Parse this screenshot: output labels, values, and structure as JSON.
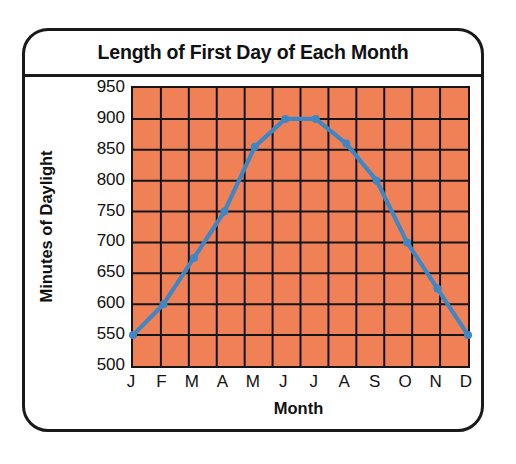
{
  "chart_data": {
    "type": "line",
    "title": "Length of First Day of Each Month",
    "xlabel": "Month",
    "ylabel": "Minutes of Daylight",
    "categories": [
      "J",
      "F",
      "M",
      "A",
      "M",
      "J",
      "J",
      "A",
      "S",
      "O",
      "N",
      "D"
    ],
    "month_names": [
      "January",
      "February",
      "March",
      "April",
      "May",
      "June",
      "July",
      "August",
      "September",
      "October",
      "November",
      "December"
    ],
    "values": [
      550,
      600,
      675,
      750,
      855,
      900,
      900,
      860,
      800,
      700,
      625,
      550
    ],
    "series": [
      {
        "name": "Minutes of Daylight",
        "values": [
          550,
          600,
          675,
          750,
          855,
          900,
          900,
          860,
          800,
          700,
          625,
          550
        ]
      }
    ],
    "ylim": [
      500,
      950
    ],
    "ytick_labels": [
      "950",
      "900",
      "850",
      "800",
      "750",
      "700",
      "650",
      "600",
      "550",
      "500"
    ],
    "ytick_values": [
      950,
      900,
      850,
      800,
      750,
      700,
      650,
      600,
      550,
      500
    ],
    "ytick_step": 50,
    "grid": true,
    "legend": false,
    "colors": {
      "plot_background": "#f08157",
      "grid_line": "#151515",
      "series_line": "#3f87c4",
      "marker": "#3f87c4",
      "frame": "#1a1a1a",
      "text": "#111111"
    }
  }
}
